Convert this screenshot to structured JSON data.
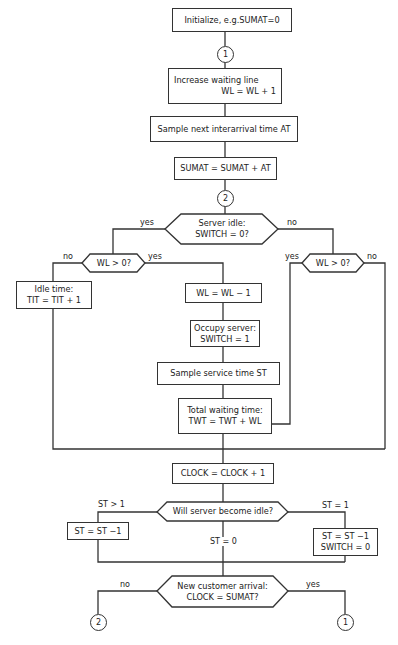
{
  "boxes": {
    "init": "Initialize, e.g.SUMAT=0",
    "increase_1": "Increase waiting line",
    "increase_2": "WL  =  WL + 1",
    "sample_at": "Sample next interarrival time  AT",
    "sumat": "SUMAT = SUMAT + AT",
    "idle_1": "Idle time:",
    "idle_2": "TIT  =  TIT + 1",
    "wl_dec": "WL = WL  − 1",
    "occupy_1": "Occupy server:",
    "occupy_2": "SWITCH = 1",
    "sample_st": "Sample service time  ST",
    "twt_1": "Total waiting time:",
    "twt_2": "TWT   = TWT + WL",
    "clock": "CLOCK = CLOCK + 1",
    "st_left": "ST = ST −1",
    "st_right_1": "ST = ST −1",
    "st_right_2": "SWITCH = 0"
  },
  "decisions": {
    "server_idle_1": "Server idle:",
    "server_idle_2": "SWITCH = 0?",
    "wl_left": "WL > 0?",
    "wl_right": "WL > 0?",
    "will_idle": "Will  server  become idle?",
    "new_arrival_1": "New customer arrival:",
    "new_arrival_2": "CLOCK = SUMAT?"
  },
  "connectors": {
    "c1_top": "1",
    "c2_mid": "2",
    "c2_bottom": "2",
    "c1_bottom": "1"
  },
  "labels": {
    "server_yes": "yes",
    "server_no": "no",
    "wl_left_no": "no",
    "wl_left_yes": "yes",
    "wl_right_yes": "yes",
    "wl_right_no": "no",
    "st_gt1": "ST > 1",
    "st_eq0": "ST = 0",
    "st_eq1": "ST = 1",
    "arrival_no": "no",
    "arrival_yes": "yes"
  }
}
